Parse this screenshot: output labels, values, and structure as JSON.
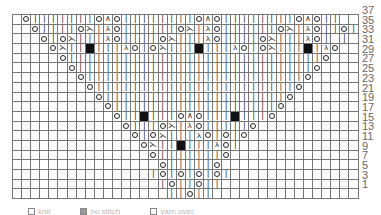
{
  "chart": {
    "row_labels": [
      "37",
      "35",
      "33",
      "31",
      "29",
      "27",
      "25",
      "23",
      "21",
      "19",
      "17",
      "15",
      "13",
      "11",
      "9",
      "7",
      "5",
      "3",
      "1"
    ],
    "symbol_key": {
      "k": "knit",
      "o": "yarn-over",
      "A": "centered-double-decrease",
      "L": "k2tog",
      "R": "ssk",
      "X": "no-stitch",
      " ": "empty"
    },
    "rows": [
      " okkkkkkkoAokkkkkkkkoAokkkkkkkkoAokk  o",
      "  okkkkoLkRokkkkkkoLkRokkkkkkoLkRokkok",
      "   okoLkkkRokkkkoLkkkRokkkkoLkkkRok k ",
      "    oLkkXkkkRokoLkkkXkkkRokoLkkkXkRo  ",
      "     okkkkkkkkkkkkkkkkkkkkkkkkkkkko   ",
      "      okkkkkkkkkkkkkkkkkkkkkkkkkko    ",
      "       okkkkkkkkkkkkkkkkkkkkkkkko     ",
      "        okkkkkkkkkkkkkkkkkkkkkko      ",
      "         okkkkkkkkkkkkkkkkkkkko       ",
      "          okkkkkkkkkkkkkkkkkko        ",
      "           okkXkkkoAokkkXkkko         ",
      "            okkkoLkRokkkkko           ",
      "             okoLkkkRokoko            ",
      "              oLkkXkkkRok             ",
      "               okkkkkkko              ",
      "                okkkkko               ",
      "               kokokokok              ",
      "                kokkokk               ",
      "                 kkokk                "
    ]
  },
  "legend": {
    "items": [
      "knit",
      "no stitch",
      "yarn over"
    ]
  }
}
